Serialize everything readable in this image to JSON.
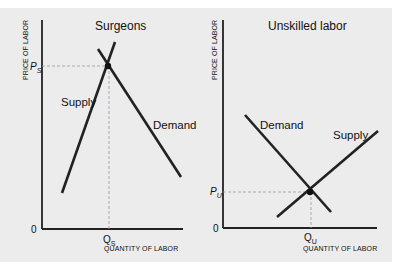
{
  "diagram": {
    "panels": [
      {
        "id": "surgeons",
        "title": "Surgeons",
        "y_axis_label": "PRICE OF LABOR",
        "x_axis_label": "QUANTITY OF LABOR",
        "origin_label": "0",
        "price_label": {
          "main": "P",
          "sub": "S"
        },
        "quantity_label": {
          "main": "Q",
          "sub": "S"
        },
        "curves": [
          {
            "name": "Supply",
            "slope": "steep-upward"
          },
          {
            "name": "Demand",
            "slope": "downward"
          }
        ],
        "equilibrium": {
          "price": "P_S",
          "quantity": "Q_S",
          "note": "high price, low quantity"
        }
      },
      {
        "id": "unskilled",
        "title": "Unskilled labor",
        "y_axis_label": "PRICE OF LABOR",
        "x_axis_label": "QUANTITY OF LABOR",
        "origin_label": "0",
        "price_label": {
          "main": "P",
          "sub": "U"
        },
        "quantity_label": {
          "main": "Q",
          "sub": "U"
        },
        "curves": [
          {
            "name": "Demand",
            "slope": "downward"
          },
          {
            "name": "Supply",
            "slope": "gentle-upward"
          }
        ],
        "equilibrium": {
          "price": "P_U",
          "quantity": "Q_U",
          "note": "low price, high quantity"
        }
      }
    ],
    "colors": {
      "background": "#ececec",
      "line": "#222222",
      "guide": "#9a9a9a"
    }
  }
}
